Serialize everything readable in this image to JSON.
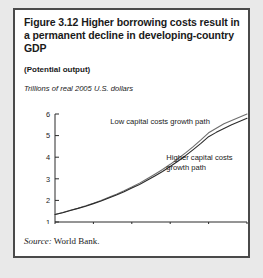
{
  "figure": {
    "title": "Figure 3.12  Higher borrowing costs result in a permanent decline in developing-country GDP",
    "subtitle": "(Potential output)",
    "source_label": "Source:",
    "source_value": "World Bank."
  },
  "chart_data": {
    "type": "line",
    "title": "Figure 3.12  Higher borrowing costs result in a permanent decline in developing-country GDP",
    "subtitle": "(Potential output)",
    "ylabel": "Trillions of real 2005 U.S. dollars",
    "xlabel": "",
    "xlim": [
      2005,
      2030
    ],
    "ylim": [
      1,
      6
    ],
    "xticks": [
      2005,
      2010,
      2015,
      2020,
      2025,
      2030
    ],
    "xtick_labels": [
      "2005",
      "2010",
      "2015",
      "2020",
      "2025",
      "2030"
    ],
    "yticks": [
      1,
      2,
      3,
      4,
      5,
      6
    ],
    "ytick_labels": [
      "1",
      "2",
      "3",
      "4",
      "5",
      "6"
    ],
    "grid": false,
    "legend_position": "inline-annotations",
    "x": [
      2005,
      2006,
      2007,
      2008,
      2009,
      2010,
      2011,
      2012,
      2013,
      2014,
      2015,
      2016,
      2017,
      2018,
      2019,
      2020,
      2021,
      2022,
      2023,
      2024,
      2025,
      2026,
      2027,
      2028,
      2029,
      2030
    ],
    "series": [
      {
        "name": "Low capital costs growth path",
        "color": "#6e6e6e",
        "values": [
          1.35,
          1.44,
          1.54,
          1.64,
          1.75,
          1.87,
          2.0,
          2.14,
          2.29,
          2.45,
          2.62,
          2.8,
          3.0,
          3.21,
          3.43,
          3.67,
          3.93,
          4.2,
          4.49,
          4.8,
          5.13,
          5.34,
          5.55,
          5.7,
          5.85,
          6.0
        ]
      },
      {
        "name": "Higher capital costs growth path",
        "color": "#2b2b2b",
        "values": [
          1.35,
          1.43,
          1.53,
          1.63,
          1.73,
          1.85,
          1.97,
          2.11,
          2.25,
          2.4,
          2.57,
          2.74,
          2.93,
          3.13,
          3.34,
          3.57,
          3.81,
          4.07,
          4.35,
          4.64,
          4.95,
          5.15,
          5.33,
          5.5,
          5.65,
          5.8
        ]
      }
    ],
    "annotations": [
      {
        "text": "Low capital costs growth path",
        "x": 2012.2,
        "y": 5.55
      },
      {
        "text_line1": "Higher capital costs",
        "text_line2": "growth path",
        "x": 2019.5,
        "y": 3.85
      }
    ]
  }
}
